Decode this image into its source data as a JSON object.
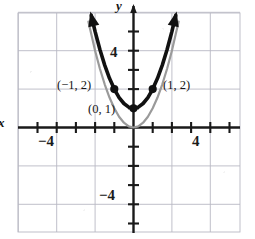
{
  "figure": {
    "kind": "cartesian-graph",
    "colors": {
      "primary_curve": "#111111",
      "secondary_curve": "#9a9a9a",
      "axis": "#1a1a1a",
      "grid": "#b9b9c4",
      "background": "#ffffff"
    },
    "axis_labels": {
      "x": "x",
      "y": "y"
    },
    "tick_labels": {
      "x_negative": "−4",
      "x_positive": "4",
      "y_positive": "4",
      "y_negative": "−4"
    },
    "point_labels": {
      "left": "(−1, 2)",
      "right": "(1, 2)",
      "vertex": "(0, 1)"
    }
  },
  "chart_data": {
    "type": "line",
    "title": "",
    "xlabel": "x",
    "ylabel": "y",
    "xlim": [
      -5.2,
      5.2
    ],
    "ylim": [
      -5.6,
      5.6
    ],
    "grid": true,
    "grid_step": 2,
    "tick_step": 1,
    "legend": "none",
    "xticks": [
      -4,
      4
    ],
    "yticks": [
      -4,
      4
    ],
    "xticklabels": [
      "−4",
      "4"
    ],
    "yticklabels": [
      "−4",
      "4"
    ],
    "series": [
      {
        "name": "y = x² + 1",
        "style": "solid",
        "color": "#111111",
        "weight": "heavy",
        "arrows": "both-ends-up",
        "x": [
          -2.2,
          -2.0,
          -1.75,
          -1.5,
          -1.25,
          -1.0,
          -0.75,
          -0.5,
          -0.25,
          0,
          0.25,
          0.5,
          0.75,
          1.0,
          1.25,
          1.5,
          1.75,
          2.0,
          2.2
        ],
        "y": [
          5.84,
          5.0,
          4.06,
          3.25,
          2.56,
          2.0,
          1.56,
          1.25,
          1.06,
          1.0,
          1.06,
          1.25,
          1.56,
          2.0,
          2.56,
          3.25,
          4.06,
          5.0,
          5.84
        ]
      },
      {
        "name": "y = x²",
        "style": "solid",
        "color": "#9a9a9a",
        "weight": "light",
        "arrows": "none",
        "x": [
          -2.35,
          -2.0,
          -1.75,
          -1.5,
          -1.25,
          -1.0,
          -0.75,
          -0.5,
          -0.25,
          0,
          0.25,
          0.5,
          0.75,
          1.0,
          1.25,
          1.5,
          1.75,
          2.0,
          2.35
        ],
        "y": [
          5.52,
          4.0,
          3.06,
          2.25,
          1.56,
          1.0,
          0.56,
          0.25,
          0.06,
          0,
          0.06,
          0.25,
          0.56,
          1.0,
          1.56,
          2.25,
          3.06,
          4.0,
          5.52
        ]
      }
    ],
    "annotated_points": [
      {
        "label": "(−1, 2)",
        "x": -1,
        "y": 2,
        "marker": "filled-circle"
      },
      {
        "label": "(0, 1)",
        "x": 0,
        "y": 1,
        "marker": "filled-circle"
      },
      {
        "label": "(1, 2)",
        "x": 1,
        "y": 2,
        "marker": "filled-circle"
      }
    ]
  }
}
